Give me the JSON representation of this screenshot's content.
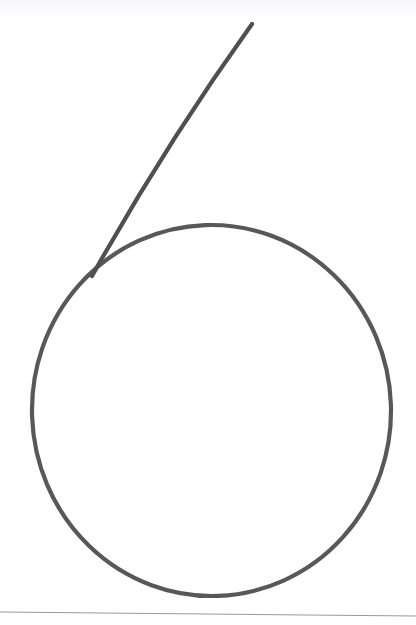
{
  "canvas": {
    "width": 416,
    "height": 625,
    "background_color": "#ffffff",
    "paper_tint_color": "#f4f5f7"
  },
  "ink": {
    "color": "#4f4f50",
    "secondary_color": "#58585a",
    "stroke_width": 4.2,
    "rule_line_color": "#9a9a9c",
    "rule_line_width": 1.1
  },
  "drawing": {
    "label": "handwritten-digit-6",
    "description": "A large hand-drawn oval loop with a long diagonal stroke descending from the upper right into the upper-left of the loop, forming the numeral six.",
    "strokes": [
      {
        "name": "diagonal-stem-stroke",
        "kind": "open-curve",
        "start_point": [
          252,
          24
        ],
        "end_point": [
          92,
          276
        ],
        "control_point": [
          168,
          146
        ],
        "path": "M252,24 Q166,144 92,276"
      },
      {
        "name": "oval-loop-stroke",
        "kind": "closed-oval",
        "center": [
          211.5,
          410.5
        ],
        "radius_x": 179.5,
        "radius_y": 185.5,
        "bounds": {
          "left": 32,
          "top": 225,
          "right": 391,
          "bottom": 596
        },
        "rotation_deg": -2
      }
    ]
  },
  "artifacts": {
    "bottom_rule": {
      "name": "page-edge-rule",
      "start_point": [
        0,
        612
      ],
      "end_point": [
        416,
        616
      ]
    }
  },
  "chart_data": {
    "type": "scatter",
    "xlabel": "",
    "ylabel": "",
    "xlim": [
      0,
      416
    ],
    "ylim": [
      625,
      0
    ],
    "series": [
      {
        "name": "diagonal-stem-stroke",
        "x": [
          252,
          225,
          198,
          171,
          144,
          122,
          106,
          92
        ],
        "y": [
          24,
          63,
          101,
          140,
          180,
          215,
          246,
          276
        ]
      },
      {
        "name": "oval-loop-stroke",
        "x": [
          211,
          300,
          362,
          391,
          380,
          320,
          225,
          120,
          55,
          32,
          45,
          110,
          175,
          211
        ],
        "y": [
          225,
          236,
          287,
          370,
          470,
          551,
          596,
          583,
          520,
          425,
          330,
          260,
          228,
          225
        ]
      }
    ]
  }
}
